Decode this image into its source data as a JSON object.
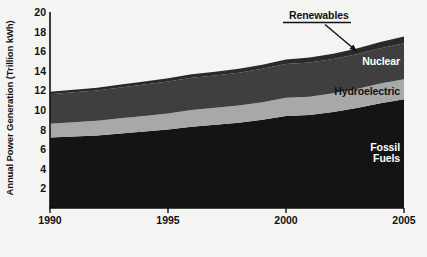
{
  "chart_data": {
    "type": "area",
    "stacked": true,
    "title": "",
    "xlabel": "",
    "ylabel": "Annual Power Generation (Trillion kWh)",
    "x": [
      1990,
      1991,
      1992,
      1993,
      1994,
      1995,
      1996,
      1997,
      1998,
      1999,
      2000,
      2001,
      2002,
      2003,
      2004,
      2005
    ],
    "xlim": [
      1990,
      2005
    ],
    "ylim": [
      0,
      20
    ],
    "xticks": [
      1990,
      1995,
      2000,
      2005
    ],
    "xtick_labels": [
      "1990",
      "1995",
      "2000",
      "2005"
    ],
    "yticks": [
      2,
      4,
      6,
      8,
      10,
      12,
      14,
      16,
      18,
      20
    ],
    "ytick_labels": [
      "2",
      "4",
      "6",
      "8",
      "10",
      "12",
      "14",
      "16",
      "18",
      "20"
    ],
    "grid": false,
    "legend": "inline-labels",
    "series": [
      {
        "name": "Fossil Fuels",
        "color": "#141414",
        "label_color": "#ffffff",
        "values": [
          7.2,
          7.3,
          7.4,
          7.6,
          7.8,
          8.0,
          8.3,
          8.5,
          8.7,
          9.0,
          9.4,
          9.5,
          9.8,
          10.2,
          10.7,
          11.1
        ]
      },
      {
        "name": "Hydroelectric",
        "color": "#a8a8a8",
        "label_color": "#111111",
        "values": [
          1.4,
          1.45,
          1.5,
          1.55,
          1.6,
          1.65,
          1.7,
          1.72,
          1.75,
          1.8,
          1.85,
          1.85,
          1.9,
          1.95,
          2.0,
          2.05
        ]
      },
      {
        "name": "Nuclear",
        "color": "#3f3f3f",
        "label_color": "#ffffff",
        "values": [
          3.0,
          3.05,
          3.1,
          3.15,
          3.2,
          3.25,
          3.3,
          3.3,
          3.35,
          3.4,
          3.45,
          3.5,
          3.5,
          3.55,
          3.6,
          3.65
        ]
      },
      {
        "name": "Renewables",
        "color": "#2a2a2a",
        "label_color": "#111111",
        "values": [
          0.25,
          0.26,
          0.28,
          0.3,
          0.32,
          0.34,
          0.36,
          0.38,
          0.4,
          0.43,
          0.46,
          0.5,
          0.54,
          0.58,
          0.63,
          0.7
        ]
      }
    ],
    "annotations": [
      {
        "name": "renewables-callout",
        "text": "Renewables",
        "points_to_series": "Renewables",
        "style": "underlined-label-with-arrow"
      }
    ]
  },
  "labels": {
    "renewables": "Renewables",
    "nuclear": "Nuclear",
    "hydroelectric": "Hydroelectric",
    "fossil_fuels": "Fossil\nFuels"
  },
  "colors": {
    "background": "#f4f4f2",
    "axis": "#111111",
    "fossil_fuels": "#141414",
    "hydroelectric": "#a8a8a8",
    "nuclear": "#3f3f3f",
    "renewables": "#2a2a2a",
    "text": "#111111"
  }
}
